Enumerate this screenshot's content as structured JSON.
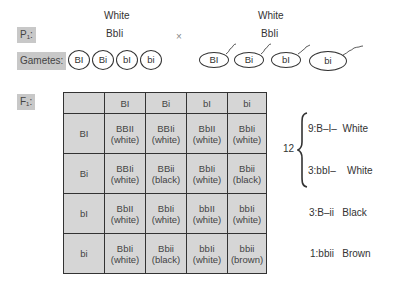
{
  "parents": {
    "label": "P₁:",
    "left": {
      "phenotype": "White",
      "genotype": "BbIi"
    },
    "cross_symbol": "×",
    "right": {
      "phenotype": "White",
      "genotype": "BbIi"
    }
  },
  "gametes": {
    "label": "Gametes:",
    "female": [
      "BI",
      "Bi",
      "bI",
      "bi"
    ],
    "male": [
      "BI",
      "Bi",
      "bI",
      "bi"
    ]
  },
  "f1": {
    "label": "F₁:",
    "column_headers": [
      "",
      "BI",
      "Bi",
      "bI",
      "bi"
    ],
    "rows": [
      {
        "header": "BI",
        "cells": [
          {
            "genotype": "BBII",
            "phenotype": "(white)"
          },
          {
            "genotype": "BBIi",
            "phenotype": "(white)"
          },
          {
            "genotype": "BbII",
            "phenotype": "(white)"
          },
          {
            "genotype": "BbIi",
            "phenotype": "(white)"
          }
        ]
      },
      {
        "header": "Bi",
        "cells": [
          {
            "genotype": "BBIi",
            "phenotype": "(white)"
          },
          {
            "genotype": "BBii",
            "phenotype": "(black)"
          },
          {
            "genotype": "BbIi",
            "phenotype": "(white)"
          },
          {
            "genotype": "Bbii",
            "phenotype": "(black)"
          }
        ]
      },
      {
        "header": "bI",
        "cells": [
          {
            "genotype": "BbII",
            "phenotype": "(white)"
          },
          {
            "genotype": "BbIi",
            "phenotype": "(white)"
          },
          {
            "genotype": "bbII",
            "phenotype": "(white)"
          },
          {
            "genotype": "bbIi",
            "phenotype": "(white)"
          }
        ]
      },
      {
        "header": "bi",
        "cells": [
          {
            "genotype": "BbIi",
            "phenotype": "(white)"
          },
          {
            "genotype": "Bbii",
            "phenotype": "(black)"
          },
          {
            "genotype": "bbIi",
            "phenotype": "(white)"
          },
          {
            "genotype": "bbii",
            "phenotype": "(brown)"
          }
        ]
      }
    ]
  },
  "ratios": {
    "group_total": "12",
    "items": [
      {
        "ratio": "9:B–I–",
        "phenotype": "White"
      },
      {
        "ratio": "3:bbI–",
        "phenotype": "White"
      },
      {
        "ratio": "3:B–ii",
        "phenotype": "Black"
      },
      {
        "ratio": "1:bbii",
        "phenotype": "Brown"
      }
    ]
  }
}
